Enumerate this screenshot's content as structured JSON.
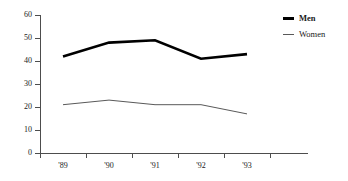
{
  "chart_data": {
    "type": "line",
    "title": "",
    "subtitle": "",
    "xlabel": "",
    "ylabel": "",
    "categories": [
      "'89",
      "'90",
      "'91",
      "'92",
      "'93"
    ],
    "x_tick_labels": [
      "'89",
      "'90",
      "'91",
      "'92",
      "'93"
    ],
    "y_tick_labels": [
      "0",
      "10",
      "20",
      "30",
      "40",
      "50",
      "60"
    ],
    "y_ticks": [
      0,
      10,
      20,
      30,
      40,
      50,
      60
    ],
    "ylim": [
      0,
      60
    ],
    "grid": false,
    "legend_position": "top-right",
    "series": [
      {
        "name": "Men",
        "values": [
          42,
          48,
          49,
          41,
          43
        ],
        "color": "#000000",
        "line_width": 2.6,
        "emphasis": "bold"
      },
      {
        "name": "Women",
        "values": [
          21,
          23,
          21,
          21,
          17
        ],
        "color": "#595959",
        "line_width": 1,
        "emphasis": "normal"
      }
    ]
  },
  "legend": {
    "items": [
      {
        "label": "Men",
        "swatch": "thick-line-swatch"
      },
      {
        "label": "Women",
        "swatch": "thin-line-swatch"
      }
    ]
  },
  "axes": {
    "x_axis_name": "year-axis",
    "y_axis_name": "value-axis"
  },
  "colors": {
    "background": "#ffffff",
    "axis": "#4d4d4d",
    "text": "#1a1a1a",
    "series_men": "#000000",
    "series_women": "#595959"
  }
}
